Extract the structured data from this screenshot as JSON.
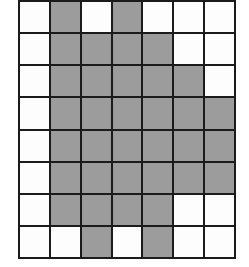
{
  "colors": {
    "filled": "#9c9c9c",
    "empty": "#fdfdfd",
    "gridline": "#1b1b1b",
    "background": "#ffffff"
  },
  "chart_data": {
    "type": "heatmap",
    "title": "",
    "xlabel": "",
    "ylabel": "",
    "columns": 7,
    "rows": 8,
    "legend": [
      {
        "key": "0",
        "label": "unshaded",
        "color": "#fdfdfd"
      },
      {
        "key": "1",
        "label": "shaded",
        "color": "#9c9c9c"
      }
    ],
    "values": [
      [
        0,
        1,
        0,
        1,
        0,
        0,
        0
      ],
      [
        0,
        1,
        1,
        1,
        1,
        0,
        0
      ],
      [
        0,
        1,
        1,
        1,
        1,
        1,
        0
      ],
      [
        0,
        1,
        1,
        1,
        1,
        1,
        1
      ],
      [
        0,
        1,
        1,
        1,
        1,
        1,
        1
      ],
      [
        0,
        1,
        1,
        1,
        1,
        1,
        1
      ],
      [
        0,
        1,
        1,
        1,
        1,
        0,
        0
      ],
      [
        0,
        0,
        1,
        0,
        1,
        0,
        0
      ]
    ],
    "shaded_count": 34,
    "total_cells": 56
  }
}
